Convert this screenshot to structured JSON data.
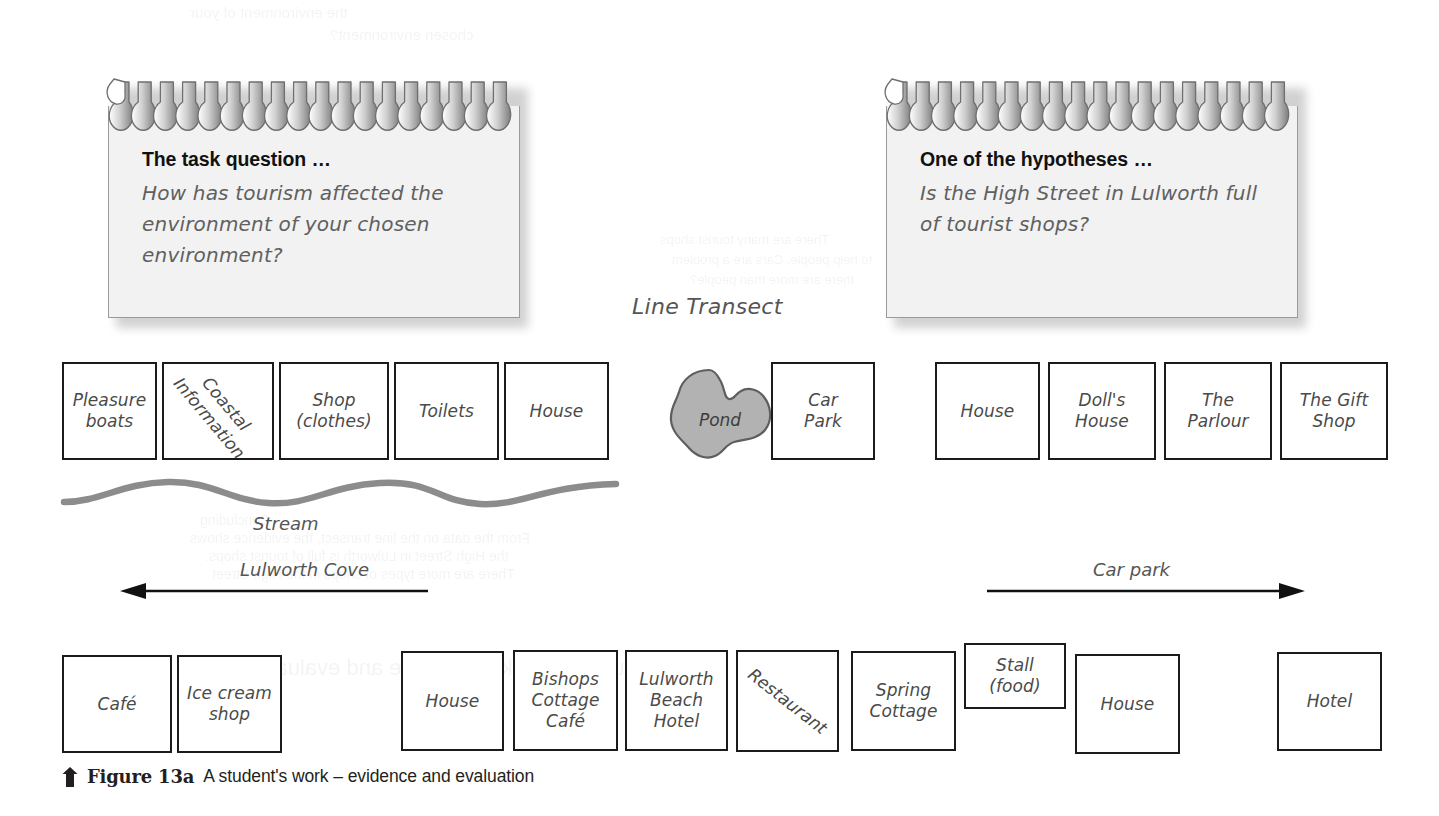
{
  "figure": {
    "transect_title": "Line Transect",
    "caption_number": "Figure 13a",
    "caption_text": "A student's work – evidence and evaluation",
    "caption_icon": "up-arrow-icon"
  },
  "notes": [
    {
      "id": "task-question",
      "title": "The task question …",
      "body": "How has tourism affected the environment of your chosen environment?"
    },
    {
      "id": "hypothesis",
      "title": "One of the hypotheses …",
      "body": "Is the High Street in Lulworth full of tourist shops?"
    }
  ],
  "top_row_left": [
    {
      "label": "Pleasure\nboats",
      "rotated": false
    },
    {
      "label": "Coastal\nInformation",
      "rotated": true
    },
    {
      "label": "Shop\n(clothes)",
      "rotated": false
    },
    {
      "label": "Toilets",
      "rotated": false
    },
    {
      "label": "House",
      "rotated": false
    }
  ],
  "pond": {
    "label": "Pond",
    "fill": "#b2b2b2",
    "stroke": "#5e5e5e"
  },
  "car_park_box": {
    "label": "Car\nPark"
  },
  "top_row_right": [
    {
      "label": "House"
    },
    {
      "label": "Doll's\nHouse"
    },
    {
      "label": "The\nParlour"
    },
    {
      "label": "The Gift\nShop"
    }
  ],
  "stream": {
    "label": "Stream",
    "color": "#8c8c8c"
  },
  "arrows": [
    {
      "id": "lulworth-cove",
      "label": "Lulworth Cove",
      "direction": "left"
    },
    {
      "id": "car-park",
      "label": "Car park",
      "direction": "right"
    }
  ],
  "bottom_row": [
    {
      "label": "Café",
      "rotated": false
    },
    {
      "label": "Ice cream\nshop",
      "rotated": false
    },
    {
      "label": "House",
      "rotated": false
    },
    {
      "label": "Bishops\nCottage\nCafé",
      "rotated": false
    },
    {
      "label": "Lulworth\nBeach\nHotel",
      "rotated": false
    },
    {
      "label": "Restaurant",
      "rotated": true
    },
    {
      "label": "Spring\nCottage",
      "rotated": false
    },
    {
      "label": "Stall\n(food)",
      "rotated": false
    },
    {
      "label": "House",
      "rotated": false
    },
    {
      "label": "Hotel",
      "rotated": false
    }
  ],
  "bleed_through": [
    "the environment of your",
    "chosen environment?",
    "There are many tourist shops",
    "to help people. Cars are a problem",
    "there are more than people?",
    "Concluding",
    "From the data on the line transect, the evidence shows",
    "the High Street in Lulworth is full of tourist shops.",
    "There are more types of shops in the High Street",
    "A student's work – evidence and evaluation"
  ],
  "colors": {
    "box_border": "#1b1b1b",
    "label_text": "#4a4a4a",
    "note_body": "#f2f2f2",
    "note_border": "#9a9a9a",
    "stream": "#8c8c8c",
    "pond_fill": "#b2b2b2"
  }
}
